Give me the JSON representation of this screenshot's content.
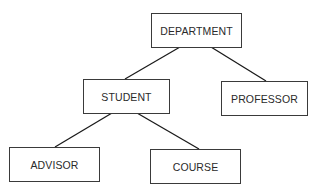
{
  "diagram": {
    "type": "hierarchy-tree",
    "nodes": [
      {
        "id": "department",
        "label": "DEPARTMENT",
        "x": 151,
        "y": 13,
        "w": 91,
        "h": 35
      },
      {
        "id": "student",
        "label": "STUDENT",
        "x": 83,
        "y": 79,
        "w": 87,
        "h": 35
      },
      {
        "id": "professor",
        "label": "PROFESSOR",
        "x": 221,
        "y": 81,
        "w": 87,
        "h": 35
      },
      {
        "id": "advisor",
        "label": "ADVISOR",
        "x": 9,
        "y": 147,
        "w": 91,
        "h": 35
      },
      {
        "id": "course",
        "label": "COURSE",
        "x": 150,
        "y": 149,
        "w": 91,
        "h": 35
      }
    ],
    "edges": [
      {
        "from": "department",
        "to": "student"
      },
      {
        "from": "department",
        "to": "professor"
      },
      {
        "from": "student",
        "to": "advisor"
      },
      {
        "from": "student",
        "to": "course"
      }
    ],
    "colors": {
      "line": "#1a1a1a",
      "border": "#3a3a3a",
      "text": "#2a2a2a",
      "background": "#ffffff"
    }
  }
}
